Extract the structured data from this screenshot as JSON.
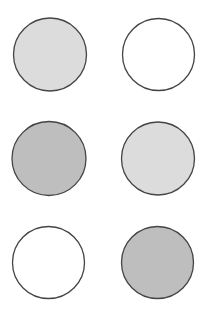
{
  "diagram": {
    "width": 207,
    "height": 319,
    "background": "#ffffff",
    "stroke_color": "#444444",
    "stroke_width": 1.3,
    "fills": {
      "light_gray": "#dcdcdc",
      "white": "#ffffff",
      "mid_gray": "#bebebe"
    },
    "circles": [
      {
        "id": "circle-1",
        "row": 1,
        "col": 1,
        "cx": 50,
        "cy": 54.5,
        "r": 36.5,
        "fill": "#dcdcdc",
        "shade": "light-gray"
      },
      {
        "id": "circle-2",
        "row": 1,
        "col": 2,
        "cx": 158.5,
        "cy": 54.5,
        "r": 36,
        "fill": "#ffffff",
        "shade": "white"
      },
      {
        "id": "circle-3",
        "row": 2,
        "col": 1,
        "cx": 49,
        "cy": 158.5,
        "r": 37,
        "fill": "#bebebe",
        "shade": "mid-gray"
      },
      {
        "id": "circle-4",
        "row": 2,
        "col": 2,
        "cx": 158,
        "cy": 158.5,
        "r": 36.5,
        "fill": "#dcdcdc",
        "shade": "light-gray"
      },
      {
        "id": "circle-5",
        "row": 3,
        "col": 1,
        "cx": 48.5,
        "cy": 262.5,
        "r": 36,
        "fill": "#ffffff",
        "shade": "white"
      },
      {
        "id": "circle-6",
        "row": 3,
        "col": 2,
        "cx": 157.5,
        "cy": 262.5,
        "r": 36,
        "fill": "#bebebe",
        "shade": "mid-gray"
      }
    ]
  }
}
